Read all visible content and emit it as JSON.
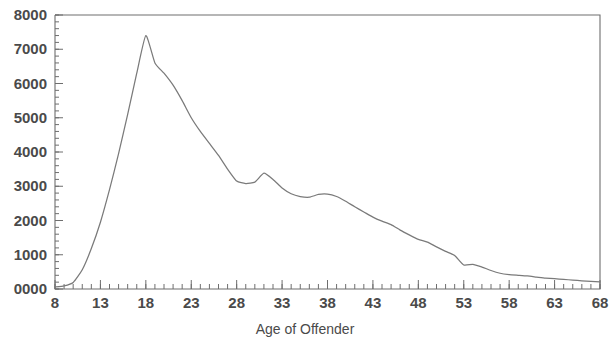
{
  "chart_data": {
    "type": "line",
    "title": "",
    "subtitle": "",
    "xlabel": "Age of Offender",
    "ylabel": "",
    "xlim": [
      8,
      68
    ],
    "ylim": [
      0,
      8000
    ],
    "grid": false,
    "legend": null,
    "x_tick_labels": [
      "8",
      "13",
      "18",
      "23",
      "28",
      "33",
      "38",
      "43",
      "48",
      "53",
      "58",
      "63",
      "68"
    ],
    "x_tick_values": [
      8,
      13,
      18,
      23,
      28,
      33,
      38,
      43,
      48,
      53,
      58,
      63,
      68
    ],
    "x_minor_tick_step": 1,
    "y_tick_labels": [
      "0000",
      "1000",
      "2000",
      "3000",
      "4000",
      "5000",
      "6000",
      "7000",
      "8000"
    ],
    "y_tick_values": [
      0,
      1000,
      2000,
      3000,
      4000,
      5000,
      6000,
      7000,
      8000
    ],
    "y_minor_tick_step": 200,
    "series": [
      {
        "name": "Offenders",
        "color": "#7a7a7a",
        "x": [
          8,
          9,
          10,
          11,
          12,
          13,
          14,
          15,
          16,
          17,
          18,
          19,
          20,
          21,
          22,
          23,
          24,
          25,
          26,
          27,
          28,
          29,
          30,
          31,
          32,
          33,
          34,
          35,
          36,
          37,
          38,
          39,
          40,
          41,
          42,
          43,
          44,
          45,
          46,
          47,
          48,
          49,
          50,
          51,
          52,
          53,
          54,
          55,
          56,
          57,
          58,
          59,
          60,
          61,
          62,
          63,
          64,
          65,
          66,
          67,
          68
        ],
        "values": [
          60,
          90,
          190,
          560,
          1180,
          1950,
          2900,
          3950,
          5100,
          6300,
          7400,
          6600,
          6300,
          5950,
          5500,
          5000,
          4600,
          4250,
          3900,
          3500,
          3150,
          3080,
          3120,
          3380,
          3200,
          2950,
          2780,
          2700,
          2680,
          2760,
          2770,
          2700,
          2560,
          2400,
          2250,
          2100,
          1980,
          1880,
          1720,
          1580,
          1450,
          1370,
          1230,
          1100,
          980,
          700,
          720,
          640,
          540,
          460,
          420,
          400,
          380,
          350,
          320,
          300,
          280,
          260,
          240,
          225,
          210
        ]
      }
    ],
    "annotations": [
      {
        "label": "peak",
        "x": 18,
        "y": 7400
      },
      {
        "label": "shoulder",
        "x": 20,
        "y": 6300
      },
      {
        "label": "local-bump",
        "x": 31,
        "y": 3380
      },
      {
        "label": "local-bump",
        "x": 38,
        "y": 2770
      },
      {
        "label": "local-bump",
        "x": 54,
        "y": 720
      }
    ]
  },
  "colors": {
    "curve": "#7a7a7a",
    "axis": "#6e6e6e",
    "text": "#4a4a4a",
    "background": "#ffffff"
  }
}
